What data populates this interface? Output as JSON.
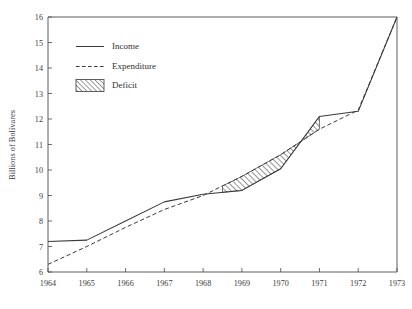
{
  "chart_data": {
    "type": "line",
    "title": "",
    "subtitle": "",
    "xlabel": "",
    "ylabel": "Billions of Bolívares",
    "xlim": [
      1964,
      1973
    ],
    "ylim": [
      6,
      16
    ],
    "grid": false,
    "legend_position": "top-left-inside",
    "x_ticks": [
      1964,
      1965,
      1966,
      1967,
      1968,
      1969,
      1970,
      1971,
      1972,
      1973
    ],
    "x_tick_labels": [
      "1964",
      "1965",
      "1966",
      "1967",
      "1968",
      "1969",
      "1970",
      "1971",
      "1972",
      "1973"
    ],
    "y_ticks": [
      6,
      7,
      8,
      9,
      10,
      11,
      12,
      13,
      14,
      15,
      16
    ],
    "y_tick_labels": [
      "6",
      "7",
      "8",
      "9",
      "10",
      "11",
      "12",
      "13",
      "14",
      "15",
      "16"
    ],
    "x": [
      1964,
      1965,
      1966,
      1967,
      1968,
      1969,
      1970,
      1971,
      1972,
      1973
    ],
    "series": [
      {
        "name": "Income",
        "style": "solid",
        "values": [
          7.2,
          7.25,
          8.0,
          8.75,
          9.05,
          9.2,
          10.05,
          12.1,
          12.3,
          16.0
        ]
      },
      {
        "name": "Expenditure",
        "style": "dashed",
        "values": [
          6.3,
          7.0,
          7.75,
          8.45,
          9.0,
          9.75,
          10.6,
          11.6,
          12.35,
          16.0
        ]
      }
    ],
    "shaded_regions": [
      {
        "name": "Deficit",
        "style": "hatched",
        "between": [
          "Income",
          "Expenditure"
        ],
        "x_start": 1968.5,
        "x_end": 1971.0
      }
    ],
    "annotations": []
  },
  "legend": {
    "entries": [
      {
        "label": "Income",
        "swatch": "solid-line"
      },
      {
        "label": "Expenditure",
        "swatch": "dashed-line"
      },
      {
        "label": "Deficit",
        "swatch": "hatched-box"
      }
    ]
  }
}
